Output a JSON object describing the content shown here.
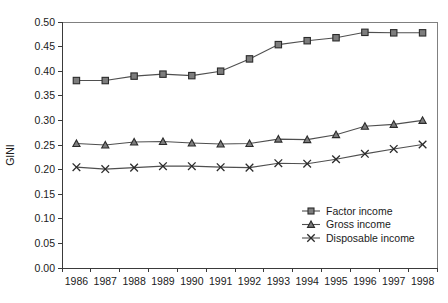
{
  "chart_data": {
    "type": "line",
    "title": "",
    "xlabel": "",
    "ylabel": "GINI",
    "categories": [
      "1986",
      "1987",
      "1988",
      "1989",
      "1990",
      "1991",
      "1992",
      "1993",
      "1994",
      "1995",
      "1996",
      "1997",
      "1998"
    ],
    "ylim": [
      0.0,
      0.5
    ],
    "yticks": [
      "0.00",
      "0.05",
      "0.10",
      "0.15",
      "0.20",
      "0.25",
      "0.30",
      "0.35",
      "0.40",
      "0.45",
      "0.50"
    ],
    "ytick_values": [
      0.0,
      0.05,
      0.1,
      0.15,
      0.2,
      0.25,
      0.3,
      0.35,
      0.4,
      0.45,
      0.5
    ],
    "grid": false,
    "legend_position": "bottom-right",
    "series": [
      {
        "name": "Factor income",
        "marker": "square",
        "values": [
          0.381,
          0.381,
          0.39,
          0.394,
          0.391,
          0.4,
          0.425,
          0.454,
          0.462,
          0.468,
          0.479,
          0.478,
          0.478
        ]
      },
      {
        "name": "Gross income",
        "marker": "triangle",
        "values": [
          0.253,
          0.25,
          0.256,
          0.257,
          0.254,
          0.252,
          0.253,
          0.262,
          0.261,
          0.271,
          0.288,
          0.292,
          0.3
        ]
      },
      {
        "name": "Disposable income",
        "marker": "cross",
        "values": [
          0.205,
          0.201,
          0.204,
          0.207,
          0.207,
          0.205,
          0.204,
          0.213,
          0.212,
          0.221,
          0.232,
          0.242,
          0.251
        ]
      }
    ]
  },
  "colors": {
    "line": "#4f4f4f",
    "marker_fill": "#7d7d7d",
    "marker_stroke": "#2b2b2b",
    "axis": "#3a3a3a",
    "frame": "#808080",
    "text": "#1a1a1a",
    "background": "#ffffff"
  }
}
